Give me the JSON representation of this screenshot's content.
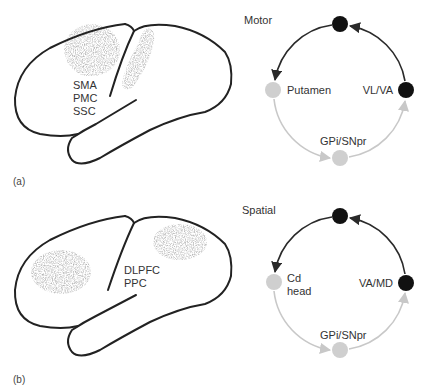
{
  "panels": [
    {
      "id": "a",
      "panel_label": "(a)",
      "loop_title": "Motor",
      "cortex_labels": [
        "SMA",
        "PMC",
        "SSC"
      ],
      "nodes": {
        "top": {
          "label": "",
          "color": "#111111"
        },
        "left": {
          "label": "Putamen",
          "color": "#cfcfcf"
        },
        "bottom": {
          "label": "GPi/SNpr",
          "color": "#cfcfcf"
        },
        "right": {
          "label": "VL/VA",
          "color": "#111111"
        }
      }
    },
    {
      "id": "b",
      "panel_label": "(b)",
      "loop_title": "Spatial",
      "cortex_labels": [
        "DLPFC",
        "PPC"
      ],
      "nodes": {
        "top": {
          "label": "",
          "color": "#111111"
        },
        "left": {
          "label_line1": "Cd",
          "label_line2": "head",
          "color": "#cfcfcf"
        },
        "bottom": {
          "label": "GPi/SNpr",
          "color": "#cfcfcf"
        },
        "right": {
          "label": "VA/MD",
          "color": "#111111"
        }
      }
    }
  ],
  "colors": {
    "outline": "#222222",
    "dark_path": "#2a2a2a",
    "light_path": "#c8c8c8",
    "stipple": "#8a8a8a"
  }
}
